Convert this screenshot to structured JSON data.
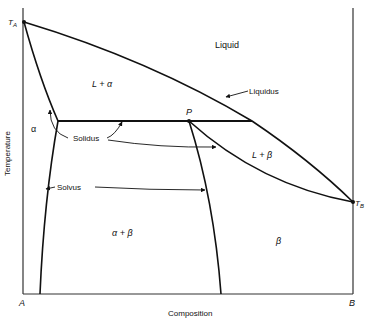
{
  "diagram": {
    "type": "binary peritectic phase diagram",
    "axes": {
      "xlabel": "Composition",
      "ylabel": "Temperature",
      "x_left_label": "A",
      "x_right_label": "B"
    },
    "points": {
      "TA": "T",
      "TA_sub": "A",
      "TB": "T",
      "TB_sub": "B",
      "P": "P"
    },
    "regions": {
      "liquid": "Liquid",
      "l_alpha": "L + α",
      "alpha": "α",
      "l_beta": "L + β",
      "alpha_beta": "α + β",
      "beta": "β"
    },
    "curve_labels": {
      "liquidus": "Liquidus",
      "solidus": "Solidus",
      "solvus": "Solvus"
    },
    "colors": {
      "line": "#111111",
      "axis": "#333333",
      "background": "#ffffff"
    }
  }
}
